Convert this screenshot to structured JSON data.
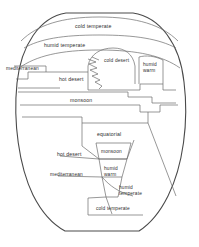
{
  "diagram": {
    "shape": "egg-oval",
    "stroke_color": "#4a4a4a",
    "band_color": "#6b6b6b",
    "background_color": "#ffffff",
    "text_color": "#2e2e2e"
  },
  "labels": {
    "cold_temperate_top": "cold temperate",
    "humid_temperate_top": "humid temperate",
    "mediterranean_top": "mediterranean",
    "hot_desert_top": "hot desert",
    "cold_desert": "cold desert",
    "humid_warm_top_line1": "humid",
    "humid_warm_top_line2": "warm",
    "monsoon_top": "monsoon",
    "equatorial": "equatorial",
    "hot_desert_bottom": "hot desert",
    "monsoon_bottom": "monsoon",
    "mediterranean_bottom": "mediterranean",
    "humid_warm_bottom_line1": "humid",
    "humid_warm_bottom_line2": "warm",
    "humid_temperate_bottom_line1": "humid",
    "humid_temperate_bottom_line2": "temperate",
    "cold_temperate_bottom": "cold temperate"
  },
  "zones": [
    {
      "id": "cold-temperate-north",
      "label": "cold temperate",
      "hemisphere": "north"
    },
    {
      "id": "humid-temperate-north",
      "label": "humid temperate",
      "hemisphere": "north"
    },
    {
      "id": "mediterranean-north",
      "label": "mediterranean",
      "hemisphere": "north"
    },
    {
      "id": "hot-desert-north",
      "label": "hot desert",
      "hemisphere": "north"
    },
    {
      "id": "cold-desert",
      "label": "cold desert",
      "hemisphere": "north"
    },
    {
      "id": "humid-warm-north",
      "label": "humid warm",
      "hemisphere": "north"
    },
    {
      "id": "monsoon-north",
      "label": "monsoon",
      "hemisphere": "north"
    },
    {
      "id": "equatorial",
      "label": "equatorial",
      "hemisphere": "equator"
    },
    {
      "id": "monsoon-south",
      "label": "monsoon",
      "hemisphere": "south"
    },
    {
      "id": "hot-desert-south",
      "label": "hot desert",
      "hemisphere": "south"
    },
    {
      "id": "mediterranean-south",
      "label": "mediterranean",
      "hemisphere": "south"
    },
    {
      "id": "humid-warm-south",
      "label": "humid warm",
      "hemisphere": "south"
    },
    {
      "id": "humid-temperate-south",
      "label": "humid temperate",
      "hemisphere": "south"
    },
    {
      "id": "cold-temperate-south",
      "label": "cold temperate",
      "hemisphere": "south"
    }
  ]
}
